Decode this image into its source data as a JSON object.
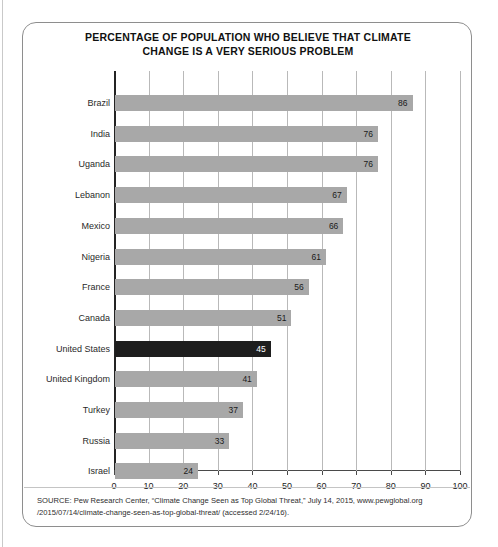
{
  "chart_data": {
    "type": "bar",
    "orientation": "horizontal",
    "title": "PERCENTAGE OF POPULATION WHO BELIEVE THAT CLIMATE CHANGE IS A VERY SERIOUS PROBLEM",
    "title_lines": [
      "PERCENTAGE OF POPULATION WHO BELIEVE THAT CLIMATE",
      "CHANGE IS A VERY SERIOUS PROBLEM"
    ],
    "xlabel": "",
    "ylabel": "",
    "xlim": [
      0,
      100
    ],
    "xticks": [
      0,
      10,
      20,
      30,
      40,
      50,
      60,
      70,
      80,
      90,
      100
    ],
    "grid": "vertical",
    "legend": "none",
    "categories": [
      "Brazil",
      "India",
      "Uganda",
      "Lebanon",
      "Mexico",
      "Nigeria",
      "France",
      "Canada",
      "United States",
      "United Kingdom",
      "Turkey",
      "Russia",
      "Israel"
    ],
    "values": [
      86,
      76,
      76,
      67,
      66,
      61,
      56,
      51,
      45,
      41,
      37,
      33,
      24
    ],
    "highlight_category": "United States",
    "colors": {
      "bar": "#a8a8a8",
      "bar_highlight": "#1e1e1e",
      "bar_value_text": "#1a1a1a",
      "bar_value_text_highlight": "#ffffff",
      "gridline": "#b9b9b9",
      "axis": "#242424",
      "card_border": "#8e8e8e",
      "background": "#ffffff"
    }
  },
  "source": {
    "text": "SOURCE: Pew Research Center, “Climate Change Seen as Top Global Threat,” July 14, 2015, www.pewglobal.org /2015/07/14/climate-change-seen-as-top-global-threat/ (accessed 2/24/16)."
  }
}
